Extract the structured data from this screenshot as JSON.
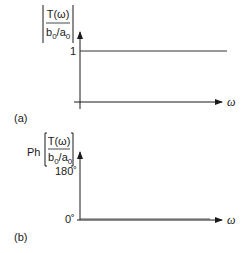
{
  "panel_a": {
    "label": "(a)",
    "y_label": {
      "numerator": "T(ω)",
      "denominator_b": "b",
      "denominator_sub0": "0",
      "denominator_slash_a": "/a",
      "denominator_sub1": "0",
      "bracket": "abs"
    },
    "y_tick": "1",
    "x_label": "ω",
    "curve": "constant magnitude 1"
  },
  "panel_b": {
    "label": "(b)",
    "y_prefix": "Ph",
    "y_label": {
      "numerator": "T(ω)",
      "denominator_b": "b",
      "denominator_sub0": "0",
      "denominator_slash_a": "/a",
      "denominator_sub1": "0",
      "bracket": "square"
    },
    "y_tick_top": "180˚",
    "y_tick_zero": "0˚",
    "x_label": "ω",
    "curve": "constant phase 0°"
  },
  "colors": {
    "axis": "#1a1a1a",
    "curve": "#333333"
  }
}
